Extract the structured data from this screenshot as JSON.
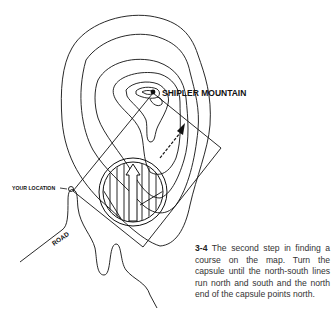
{
  "figure": {
    "number": "3-4",
    "caption": "The second step in finding a course on the map. Turn the capsule until the north-south lines run north and south and the north end of the capsule points north."
  },
  "labels": {
    "peak": "SHIPLER MOUNTAIN",
    "location": "YOUR LOCATION",
    "road": "ROAD"
  },
  "colors": {
    "ink": "#111111",
    "background": "#ffffff",
    "caption_text": "#333333"
  }
}
